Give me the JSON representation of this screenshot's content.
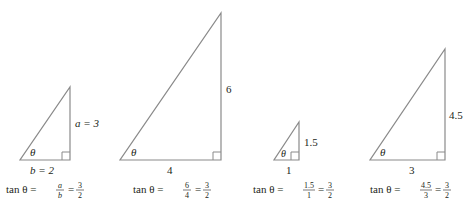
{
  "diagram": {
    "theta_symbol": "θ",
    "triangles": [
      {
        "opposite_label": "a = 3",
        "adjacent_label": "b = 2",
        "formula": {
          "prefix": "tan θ =",
          "frac1_num": "a",
          "frac1_den": "b",
          "eq": "=",
          "frac2_num": "3",
          "frac2_den": "2"
        }
      },
      {
        "opposite_label": "6",
        "adjacent_label": "4",
        "formula": {
          "prefix": "tan θ =",
          "frac1_num": "6",
          "frac1_den": "4",
          "eq": "=",
          "frac2_num": "3",
          "frac2_den": "2"
        }
      },
      {
        "opposite_label": "1.5",
        "adjacent_label": "1",
        "formula": {
          "prefix": "tan θ =",
          "frac1_num": "1.5",
          "frac1_den": "1",
          "eq": "=",
          "frac2_num": "3",
          "frac2_den": "2"
        }
      },
      {
        "opposite_label": "4.5",
        "adjacent_label": "3",
        "formula": {
          "prefix": "tan θ =",
          "frac1_num": "4.5",
          "frac1_den": "3",
          "eq": "=",
          "frac2_num": "3",
          "frac2_den": "2"
        }
      }
    ],
    "colors": {
      "stroke": "#8a8a8a",
      "text": "#231f20"
    }
  }
}
